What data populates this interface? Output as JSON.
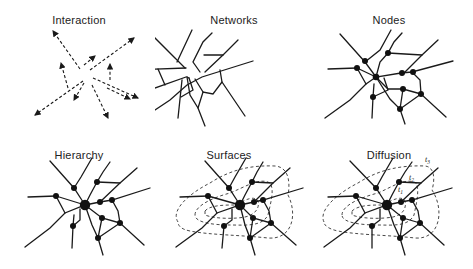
{
  "panels": [
    {
      "id": "interaction",
      "title": "Interaction"
    },
    {
      "id": "networks",
      "title": "Networks"
    },
    {
      "id": "nodes",
      "title": "Nodes"
    },
    {
      "id": "hierarchy",
      "title": "Hierarchy"
    },
    {
      "id": "surfaces",
      "title": "Surfaces"
    },
    {
      "id": "diffusion",
      "title": "Diffusion"
    }
  ],
  "diffusion_labels": {
    "t1": "t",
    "t1_sub": "1",
    "t2": "t",
    "t2_sub": "2",
    "t3": "t",
    "t3_sub": "3"
  },
  "colors": {
    "ink": "#1a1a1a",
    "background": "#ffffff"
  }
}
